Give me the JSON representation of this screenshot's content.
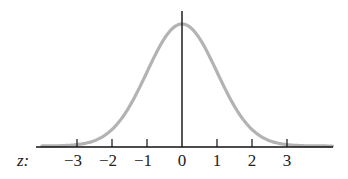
{
  "chart_data": {
    "type": "line",
    "title": "",
    "subtitle": "",
    "xlabel": "z:",
    "ylabel": "",
    "x_ticks": [
      -3,
      -2,
      -1,
      0,
      1,
      2,
      3
    ],
    "x_tick_labels": [
      "−3",
      "−2",
      "−1",
      "0",
      "1",
      "2",
      "3"
    ],
    "xlim": [
      -4.1,
      4.3
    ],
    "grid": false,
    "legend": null,
    "series": [
      {
        "name": "standard normal density",
        "function": "exp(-z^2/2)/sqrt(2*pi)",
        "mean": 0,
        "sd": 1,
        "x": [
          -4,
          -3.5,
          -3,
          -2.5,
          -2,
          -1.5,
          -1,
          -0.5,
          0,
          0.5,
          1,
          1.5,
          2,
          2.5,
          3,
          3.5,
          4
        ],
        "values": [
          0.0001,
          0.0009,
          0.0044,
          0.0175,
          0.054,
          0.1295,
          0.242,
          0.3521,
          0.3989,
          0.3521,
          0.242,
          0.1295,
          0.054,
          0.0175,
          0.0044,
          0.0009,
          0.0001
        ],
        "color": "#b3b3b3"
      }
    ],
    "vertical_line": {
      "x": 0,
      "color": "#111111"
    }
  },
  "axis": {
    "z_label": "z:",
    "ticks": [
      "−3",
      "−2",
      "−1",
      "0",
      "1",
      "2",
      "3"
    ]
  }
}
